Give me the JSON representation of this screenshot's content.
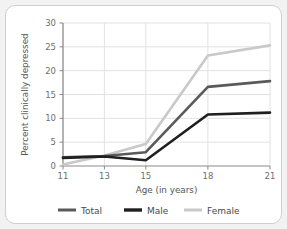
{
  "chart_data": {
    "type": "line",
    "title": "",
    "xlabel": "Age (in years)",
    "ylabel": "Percent clinically depressed",
    "x": [
      11,
      13,
      15,
      18,
      21
    ],
    "xticklabels": [
      "11",
      "13",
      "15",
      "18",
      "21"
    ],
    "yticks": [
      0,
      5,
      10,
      15,
      20,
      25,
      30
    ],
    "yticklabels": [
      "0",
      "5",
      "10",
      "15",
      "20",
      "25",
      "30"
    ],
    "xlim": [
      11,
      21
    ],
    "ylim": [
      0,
      30
    ],
    "grid": "horizontal-and-vertical",
    "legend_position": "bottom",
    "series": [
      {
        "name": "Total",
        "values": [
          1.8,
          2.1,
          2.9,
          16.6,
          17.8
        ],
        "color": "#5a5a5a"
      },
      {
        "name": "Male",
        "values": [
          1.7,
          2.0,
          1.2,
          10.8,
          11.2
        ],
        "color": "#1f1f1f"
      },
      {
        "name": "Female",
        "values": [
          0.3,
          2.2,
          4.6,
          23.2,
          25.3
        ],
        "color": "#c9c9c9"
      }
    ]
  },
  "axes": {
    "x_title": "Age (in years)",
    "y_title": "Percent clinically depressed"
  },
  "legend": {
    "items": [
      {
        "label": "Total"
      },
      {
        "label": "Male"
      },
      {
        "label": "Female"
      }
    ]
  },
  "colors": {
    "total": "#5a5a5a",
    "male": "#1f1f1f",
    "female": "#c9c9c9",
    "grid": "#e2e2e2",
    "axis": "#8a8a8a",
    "tick_text": "#6e6e6e",
    "frame_border": "#cfcfcf",
    "page_background": "#f2f2f2",
    "plot_background": "#ffffff"
  }
}
